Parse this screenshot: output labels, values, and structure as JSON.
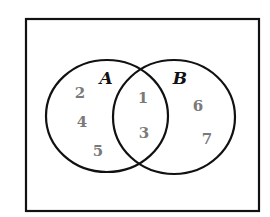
{
  "diagram": {
    "type": "venn",
    "universe": {
      "x": 26,
      "y": 19,
      "width": 233,
      "height": 192
    },
    "sets": [
      {
        "id": "A",
        "label": "A",
        "cx": 107,
        "cy": 116,
        "rx": 61,
        "ry": 56,
        "label_x": 106,
        "label_y": 84
      },
      {
        "id": "B",
        "label": "B",
        "cx": 174,
        "cy": 117,
        "rx": 61,
        "ry": 57,
        "label_x": 180,
        "label_y": 84
      }
    ],
    "regions": {
      "A_only": [
        "2",
        "4",
        "5"
      ],
      "A_and_B": [
        "1",
        "3"
      ],
      "B_only": [
        "6",
        "7"
      ]
    },
    "elements": [
      {
        "value": "2",
        "region": "A_only",
        "x": 80,
        "y": 98
      },
      {
        "value": "4",
        "region": "A_only",
        "x": 82,
        "y": 127
      },
      {
        "value": "5",
        "region": "A_only",
        "x": 98,
        "y": 156
      },
      {
        "value": "1",
        "region": "A_and_B",
        "x": 143,
        "y": 103
      },
      {
        "value": "3",
        "region": "A_and_B",
        "x": 144,
        "y": 138
      },
      {
        "value": "6",
        "region": "B_only",
        "x": 198,
        "y": 111
      },
      {
        "value": "7",
        "region": "B_only",
        "x": 207,
        "y": 144
      }
    ],
    "colors": {
      "stroke": "#111111",
      "element_text": "#7a7a7a",
      "label_text": "#111111",
      "background": "#ffffff"
    }
  }
}
